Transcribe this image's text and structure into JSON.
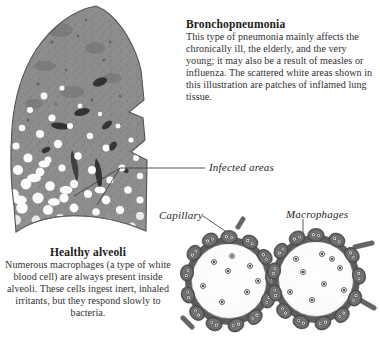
{
  "figure": {
    "type": "medical-illustration",
    "subject": "Bronchopneumonia",
    "background_color": "#ffffff"
  },
  "bronchopneumonia": {
    "heading": "Bronchopneumonia",
    "body": "This type of pneumonia mainly affects the chronically ill, the elderly, and the very young; it may also be a result of measles or influenza. The scattered white areas shown in this illustration are patches of inflamed lung tissue."
  },
  "healthy_alveoli": {
    "heading": "Healthy alveoli",
    "body": "Numerous macrophages (a type of white blood cell) are always present inside alveoli. These cells ingest inert, inhaled irritants, but they respond slowly to bacteria."
  },
  "labels": {
    "infected_areas": "Infected  areas",
    "capillary": "Capillary",
    "macrophages": "Macrophages"
  },
  "lung_diagram": {
    "name": "lung-cross-section",
    "tissue_color": "#8d8d8d",
    "tissue_dark_color": "#6f6f6f",
    "inflamed_patch_color": "#fdfdfd",
    "bronchi_color": "#3a3a3a",
    "outline_color": "#4a4a4a",
    "description": "Cross-section of a lung showing scattered white patches of inflamed tissue concentrated in the lower region"
  },
  "alveoli_diagram": {
    "name": "alveoli-pair",
    "alveolus_interior_color": "#fbfbfb",
    "cell_wall_color": "#6b6b6b",
    "cell_dark_color": "#4e4e4e",
    "nucleus_color": "#efefef",
    "macrophage_color": "#3a3a3a",
    "alveolus_count": 2,
    "description": "Two alveoli ringed by capillary cells, with macrophages shown as small dark dots inside"
  }
}
